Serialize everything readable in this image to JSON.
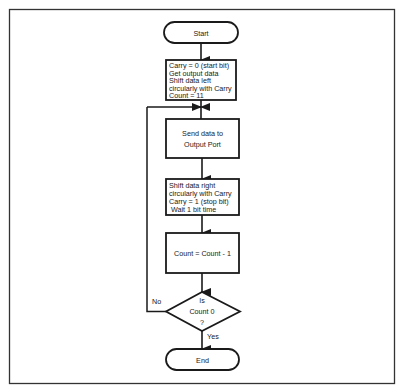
{
  "flowchart": {
    "start": {
      "label": "Start"
    },
    "init_box": {
      "lines": [
        "Carry = 0 (start bit)",
        "Get output data",
        "Shift data left",
        "circularly with Carry",
        "Count = 11"
      ]
    },
    "send_box": {
      "lines": [
        "Send data to",
        "Output Port"
      ]
    },
    "shift_box": {
      "lines": [
        "Shift data right",
        "circularly with Carry",
        "Carry = 1 (stop bit)",
        "Wait 1 bit time"
      ]
    },
    "count_box": {
      "lines": [
        "Count = Count - 1"
      ]
    },
    "decision": {
      "lines": [
        "Is",
        "Count 0",
        "?"
      ],
      "no_label": "No",
      "yes_label": "Yes"
    },
    "end": {
      "label": "End"
    }
  },
  "colors": {
    "line": "#1a1a1a",
    "frame": "#333333",
    "background": "#ffffff"
  }
}
